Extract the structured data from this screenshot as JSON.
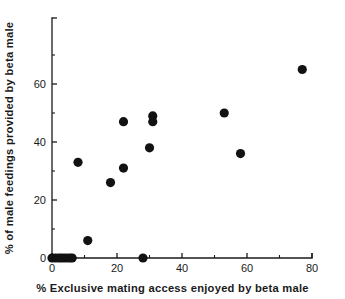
{
  "chart_data": {
    "type": "scatter",
    "title": "",
    "subtitle": "",
    "xlabel": "% Exclusive mating access enjoyed by beta male",
    "ylabel": "% of male feedings provided by beta male",
    "xlim": [
      0,
      80
    ],
    "ylim": [
      0,
      70
    ],
    "x_ticks": [
      0,
      20,
      40,
      60,
      80
    ],
    "x_tick_labels": [
      "0",
      "20",
      "40",
      "60",
      "80"
    ],
    "x_minor_ticks": [
      10,
      30,
      50,
      70
    ],
    "y_ticks": [
      0,
      20,
      40,
      60
    ],
    "y_tick_labels": [
      "0",
      "20",
      "40",
      "60"
    ],
    "y_minor_ticks": [
      10,
      30,
      50,
      70
    ],
    "grid": false,
    "legend": null,
    "marker": "filled-circle",
    "marker_color": "#121212",
    "marker_size": 4.6,
    "points": [
      {
        "x": 0.0,
        "y": 0
      },
      {
        "x": 1.0,
        "y": 0
      },
      {
        "x": 2.0,
        "y": 0
      },
      {
        "x": 2.8,
        "y": 0
      },
      {
        "x": 3.7,
        "y": 0
      },
      {
        "x": 4.6,
        "y": 0
      },
      {
        "x": 5.5,
        "y": 0
      },
      {
        "x": 6.2,
        "y": 0
      },
      {
        "x": 28.0,
        "y": 0
      },
      {
        "x": 11.0,
        "y": 6
      },
      {
        "x": 18.0,
        "y": 26
      },
      {
        "x": 22.0,
        "y": 31
      },
      {
        "x": 8.0,
        "y": 33
      },
      {
        "x": 30.0,
        "y": 38
      },
      {
        "x": 22.0,
        "y": 47
      },
      {
        "x": 31.0,
        "y": 47
      },
      {
        "x": 31.0,
        "y": 49
      },
      {
        "x": 53.0,
        "y": 50
      },
      {
        "x": 58.0,
        "y": 36
      },
      {
        "x": 77.0,
        "y": 65
      }
    ]
  },
  "colors": {
    "axis": "#1a1a1a",
    "marker": "#121212",
    "background": "#ffffff"
  }
}
